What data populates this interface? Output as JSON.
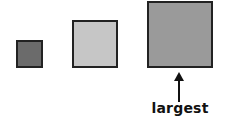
{
  "diagram": {
    "shapes": [
      {
        "id": "small",
        "type": "square",
        "size_rank": 1,
        "fill": "#6b6b6b"
      },
      {
        "id": "medium",
        "type": "square",
        "size_rank": 2,
        "fill": "#c6c6c6"
      },
      {
        "id": "large",
        "type": "square",
        "size_rank": 3,
        "fill": "#9a9a9a"
      }
    ],
    "annotation": {
      "target": "large",
      "label": "largest",
      "arrow_direction": "up"
    }
  }
}
